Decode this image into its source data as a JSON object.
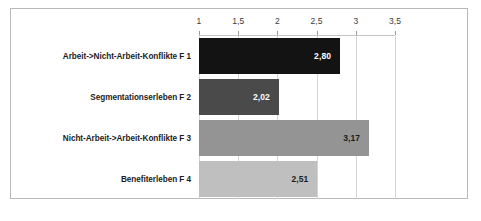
{
  "chart_data": {
    "type": "bar",
    "orientation": "horizontal",
    "title": "",
    "xlabel": "",
    "ylabel": "",
    "categories": [
      "Arbeit->Nicht-Arbeit-Konflikte F 1",
      "Segmentationserleben F 2",
      "Nicht-Arbeit->Arbeit-Konflikte F 3",
      "Benefiterleben F 4"
    ],
    "values": [
      2.8,
      2.02,
      3.17,
      2.51
    ],
    "value_labels": [
      "2,80",
      "2,02",
      "3,17",
      "2,51"
    ],
    "bar_colors": [
      "#131313",
      "#4a4a4a",
      "#949494",
      "#bfbfbf"
    ],
    "value_label_colors": [
      "#ffffff",
      "#ffffff",
      "#1d1d1d",
      "#1d1d1d"
    ],
    "xticks": [
      1,
      1.5,
      2,
      2.5,
      3,
      3.5
    ],
    "xtick_labels": [
      "1",
      "1,5",
      "2",
      "2,5",
      "3",
      "3,5"
    ],
    "xlim": [
      1,
      3.5
    ],
    "grid": true,
    "grid_axis": "x",
    "legend": false,
    "axis_position": "top"
  },
  "style": {
    "frame_color": "#b9b9b9",
    "gridline_color": "#d4d4d4",
    "axis_color": "#c4c4c4",
    "background": "#ffffff",
    "text_color": "#1d1d1d",
    "tick_label_color": "#3a3a3a"
  }
}
